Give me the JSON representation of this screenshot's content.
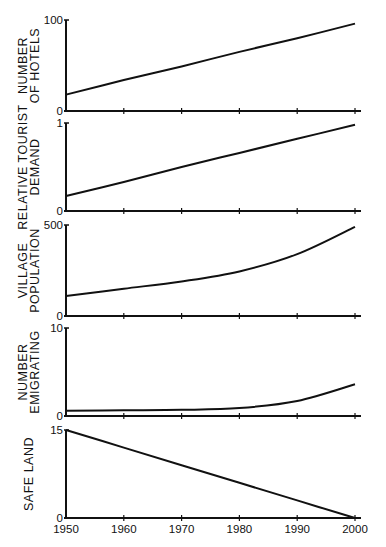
{
  "chart_data": [
    {
      "type": "line",
      "title": "",
      "ylabel": "NUMBER OF HOTELS",
      "ylabel_lines": [
        "NUMBER",
        "OF HOTELS"
      ],
      "xlabel": "",
      "x": [
        1950,
        1960,
        1970,
        1980,
        1990,
        2000
      ],
      "values": [
        18,
        34,
        49,
        65,
        80,
        96
      ],
      "ylim": [
        0,
        100
      ],
      "yticks": [
        "0",
        "100"
      ],
      "grid": false
    },
    {
      "type": "line",
      "title": "",
      "ylabel": "RELATIVE TOURIST DEMAND",
      "ylabel_lines": [
        "RELATIVE TOURIST",
        "DEMAND"
      ],
      "xlabel": "",
      "x": [
        1950,
        1960,
        1970,
        1980,
        1990,
        2000
      ],
      "values": [
        0.17,
        0.33,
        0.5,
        0.66,
        0.82,
        0.98
      ],
      "ylim": [
        0,
        1
      ],
      "yticks": [
        "0",
        "1"
      ],
      "grid": false
    },
    {
      "type": "line",
      "title": "",
      "ylabel": "VILLAGE POPULATION",
      "ylabel_lines": [
        "VILLAGE",
        "POPULATION"
      ],
      "xlabel": "",
      "x": [
        1950,
        1960,
        1970,
        1980,
        1990,
        2000
      ],
      "values": [
        110,
        150,
        190,
        245,
        340,
        490
      ],
      "ylim": [
        0,
        500
      ],
      "yticks": [
        "0",
        "500"
      ],
      "grid": false
    },
    {
      "type": "line",
      "title": "",
      "ylabel": "NUMBER EMIGRATING",
      "ylabel_lines": [
        "NUMBER",
        "EMIGRATING"
      ],
      "xlabel": "",
      "x": [
        1950,
        1960,
        1970,
        1980,
        1990,
        2000
      ],
      "values": [
        0.6,
        0.65,
        0.7,
        0.9,
        1.7,
        3.6
      ],
      "ylim": [
        0,
        10
      ],
      "yticks": [
        "0",
        "10"
      ],
      "grid": false
    },
    {
      "type": "line",
      "title": "",
      "ylabel": "SAFE LAND",
      "ylabel_lines": [
        "SAFE LAND"
      ],
      "xlabel": "",
      "x": [
        1950,
        1960,
        1970,
        1980,
        1990,
        2000
      ],
      "values": [
        15,
        12,
        9,
        6,
        3,
        0
      ],
      "ylim": [
        0,
        15
      ],
      "yticks": [
        "0",
        "15"
      ],
      "grid": false
    }
  ],
  "x_axis": {
    "tick_labels": [
      "1950",
      "1960",
      "1970",
      "1980",
      "1990",
      "2000"
    ],
    "range": [
      1950,
      2000
    ]
  },
  "layout": {
    "x0_px": 66,
    "x1_px": 355,
    "axis_end_px": 361,
    "panels_px": [
      {
        "top": 20,
        "bottom": 111
      },
      {
        "top": 123,
        "bottom": 211
      },
      {
        "top": 225,
        "bottom": 316
      },
      {
        "top": 328,
        "bottom": 416
      },
      {
        "top": 430,
        "bottom": 518
      }
    ],
    "line_color": "#111111",
    "background": "#ffffff"
  }
}
